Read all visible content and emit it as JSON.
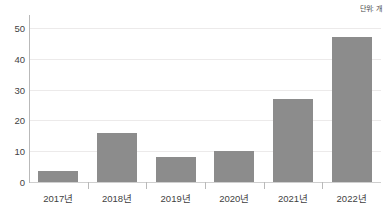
{
  "annotations": {
    "unit_note": "단위: 개"
  },
  "chart_data": {
    "type": "bar",
    "title": "",
    "subtitle": "",
    "xlabel": "",
    "ylabel": "",
    "unit_label": "단위: 개",
    "categories": [
      "2017년",
      "2018년",
      "2019년",
      "2020년",
      "2021년",
      "2022년"
    ],
    "values": [
      3.5,
      16,
      8,
      10,
      27,
      47
    ],
    "series": [
      {
        "name": "건수",
        "values": [
          3.5,
          16,
          8,
          10,
          27,
          47
        ]
      }
    ],
    "ylim": [
      0,
      53
    ],
    "y_ticks": [
      0,
      10,
      20,
      30,
      40,
      50
    ],
    "y_tick_labels": [
      "0",
      "10",
      "20",
      "30",
      "40",
      "50"
    ],
    "grid": true,
    "grid_axis": "y",
    "legend": false,
    "legend_position": "none",
    "bar_color": "#8c8c8c",
    "gridline_color": "#eceaea",
    "axis_color": "#b9b9b9",
    "background_color": "#ffffff",
    "text_color": "#3f3f3f"
  }
}
